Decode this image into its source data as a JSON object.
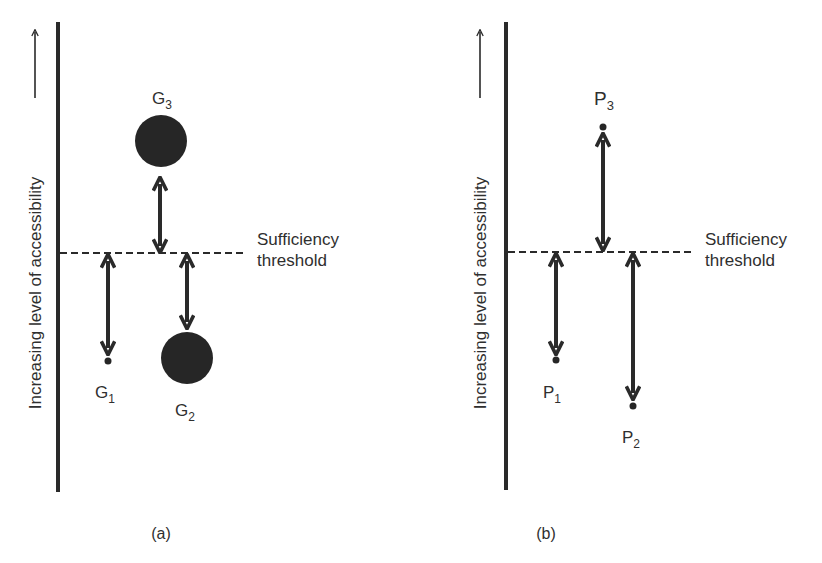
{
  "panels": [
    {
      "id": "a",
      "caption": "(a)",
      "axis_label": "Increasing level of accessibility",
      "threshold_label_line1": "Sufficiency",
      "threshold_label_line2": "threshold",
      "items": [
        {
          "name": "G",
          "sub": "1",
          "marker": "small-dot"
        },
        {
          "name": "G",
          "sub": "2",
          "marker": "large-circle"
        },
        {
          "name": "G",
          "sub": "3",
          "marker": "large-circle"
        }
      ]
    },
    {
      "id": "b",
      "caption": "(b)",
      "axis_label": "Increasing level of accessibility",
      "threshold_label_line1": "Sufficiency",
      "threshold_label_line2": "threshold",
      "items": [
        {
          "name": "P",
          "sub": "1",
          "marker": "small-dot"
        },
        {
          "name": "P",
          "sub": "2",
          "marker": "small-dot"
        },
        {
          "name": "P",
          "sub": "3",
          "marker": "small-dot"
        }
      ]
    }
  ],
  "colors": {
    "ink": "#2a2a2a",
    "background": "#ffffff"
  }
}
